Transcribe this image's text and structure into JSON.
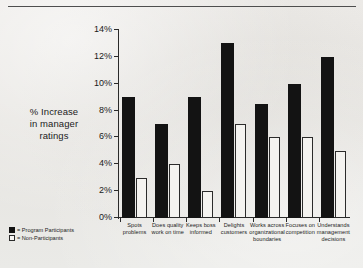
{
  "chart_data": {
    "type": "bar",
    "title": "",
    "subtitle": "",
    "xlabel": "",
    "ylabel": "% Increase in manager ratings",
    "ylabel_lines": [
      "% Increase",
      "in manager",
      "ratings"
    ],
    "ylim": [
      0,
      14
    ],
    "yticks": [
      "0%",
      "2%",
      "4%",
      "6%",
      "8%",
      "10%",
      "12%",
      "14%"
    ],
    "ytick_values": [
      0,
      2,
      4,
      6,
      8,
      10,
      12,
      14
    ],
    "grid": false,
    "legend_position": "bottom-left",
    "value_unit": "%",
    "categories": [
      "Spots problems",
      "Does quality work on time",
      "Keeps boss informed",
      "Delights customers",
      "Works across organizational boundaries",
      "Focuses on competition",
      "Understands management decisions"
    ],
    "category_lines": [
      [
        "Spots",
        "problems"
      ],
      [
        "Does quality",
        "work on time"
      ],
      [
        "Keeps boss",
        "informed"
      ],
      [
        "Delights",
        "customers"
      ],
      [
        "Works across",
        "organizational",
        "boundaries"
      ],
      [
        "Focuses on",
        "competition"
      ],
      [
        "Understands",
        "management",
        "decisions"
      ]
    ],
    "series": [
      {
        "name": "Program Participants",
        "color": "#131313",
        "style": "filled",
        "values": [
          9,
          7,
          9,
          13,
          8.5,
          10,
          12
        ]
      },
      {
        "name": "Non-Participants",
        "color": "#f4f3f0",
        "style": "outlined",
        "values": [
          3,
          4,
          2,
          7,
          6,
          6,
          5
        ]
      }
    ]
  },
  "legend": {
    "separator": "=",
    "entries": [
      {
        "label": "Program Participants",
        "swatch": "filled-black-square"
      },
      {
        "label": "Non-Participants",
        "swatch": "outlined-white-square"
      }
    ]
  }
}
